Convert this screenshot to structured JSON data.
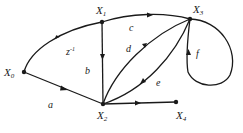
{
  "diagram": {
    "type": "signal-flow-graph",
    "nodes": [
      {
        "id": "X0",
        "label": "X",
        "sub": "0",
        "x": 24,
        "y": 72
      },
      {
        "id": "X1",
        "label": "X",
        "sub": "1",
        "x": 102,
        "y": 22
      },
      {
        "id": "X2",
        "label": "X",
        "sub": "2",
        "x": 103,
        "y": 104
      },
      {
        "id": "X3",
        "label": "X",
        "sub": "3",
        "x": 190,
        "y": 19
      },
      {
        "id": "X4",
        "label": "X",
        "sub": "4",
        "x": 176,
        "y": 102
      }
    ],
    "edges": [
      {
        "from": "X0",
        "to": "X1",
        "gain": "z⁻¹"
      },
      {
        "from": "X0",
        "to": "X2",
        "gain": "a"
      },
      {
        "from": "X1",
        "to": "X2",
        "gain": "b"
      },
      {
        "from": "X1",
        "to": "X3",
        "gain": "c"
      },
      {
        "from": "X2",
        "to": "X3",
        "gain": "d"
      },
      {
        "from": "X3",
        "to": "X2",
        "gain": "e"
      },
      {
        "from": "X3",
        "to": "X3",
        "gain": "f"
      },
      {
        "from": "X2",
        "to": "X4",
        "gain": ""
      }
    ],
    "labels": {
      "x0": "X",
      "x0_sub": "0",
      "x1": "X",
      "x1_sub": "1",
      "x2": "X",
      "x2_sub": "2",
      "x3": "X",
      "x3_sub": "3",
      "x4": "X",
      "x4_sub": "4",
      "gain_z": "z",
      "gain_z_exp": "-1",
      "gain_a": "a",
      "gain_b": "b",
      "gain_c": "c",
      "gain_d": "d",
      "gain_e": "e",
      "gain_f": "f"
    }
  }
}
